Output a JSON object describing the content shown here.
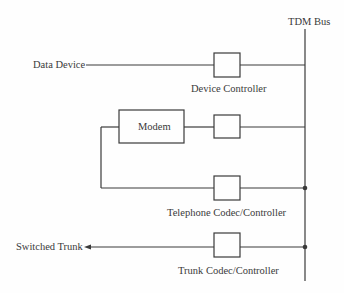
{
  "diagram": {
    "bus_label": "TDM Bus",
    "colors": {
      "line": "#3a3a3a",
      "text": "#3a3a3a",
      "background": "#fefefe"
    },
    "rows": [
      {
        "left_label": "Data Device",
        "box_label": "Device Controller"
      },
      {
        "inline_box_label": "Modem"
      },
      {
        "box_label": "Telephone Codec/Controller"
      },
      {
        "left_label": "Switched Trunk",
        "box_label": "Trunk Codec/Controller"
      }
    ]
  }
}
